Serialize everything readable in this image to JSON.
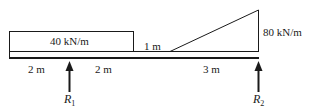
{
  "diagram": {
    "type": "beam-loading",
    "uniform_load": {
      "label": "40 kN/m",
      "value": 40,
      "unit": "kN/m",
      "from_m": 0,
      "to_m": 4
    },
    "gap_label": "1 m",
    "triangular_load": {
      "label": "80 kN/m",
      "max_value": 80,
      "unit": "kN/m",
      "from_m": 5,
      "to_m": 8
    },
    "dimensions": [
      {
        "label": "2 m"
      },
      {
        "label": "2 m"
      },
      {
        "label": "3 m"
      }
    ],
    "supports": [
      {
        "symbol": "R",
        "sub": "1",
        "position_m": 2
      },
      {
        "symbol": "R",
        "sub": "2",
        "position_m": 8
      }
    ]
  }
}
